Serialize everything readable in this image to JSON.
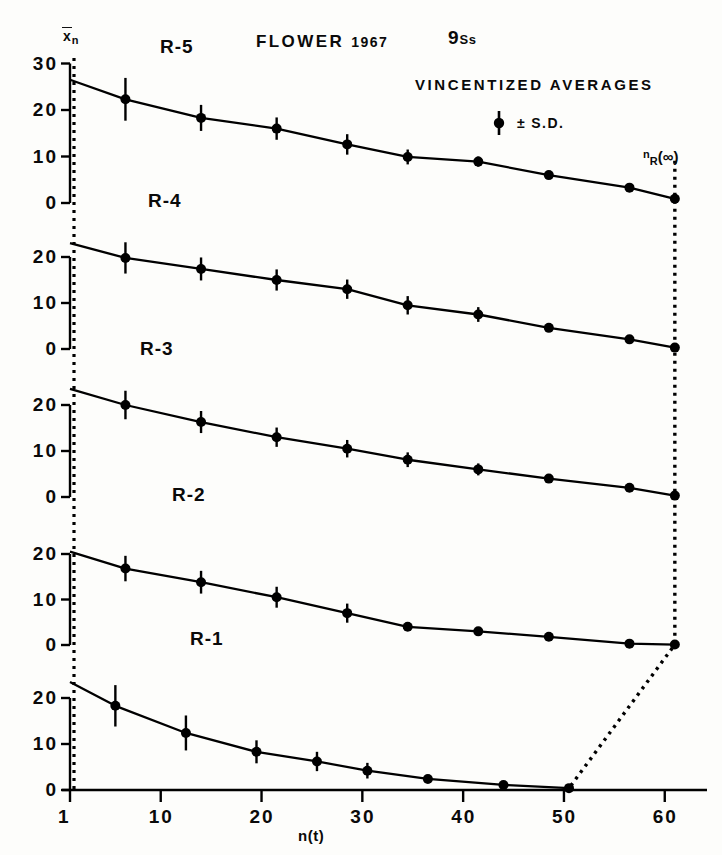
{
  "figure": {
    "title": "FLOWER",
    "year": "1967",
    "subjects": "9",
    "subjects_unit": "Ss",
    "method_note": "VINCENTIZED AVERAGES",
    "legend_sd": "± S.D.",
    "y_axis_label_main": "x",
    "y_axis_label_sub": "n",
    "x_axis_label": "n(t)",
    "asymptote_label_main": "n",
    "asymptote_label_sub": "R",
    "asymptote_label_arg": "(∞)"
  },
  "chart_data": {
    "type": "line",
    "xlabel": "n(t)",
    "ylabel": "x̄n",
    "xlim": [
      1,
      63
    ],
    "grid": false,
    "legend": "± S.D.",
    "legend_position": "top-right",
    "panels": [
      {
        "name": "R-5",
        "label": "R-5",
        "yticks": [
          0,
          10,
          20,
          30
        ],
        "ylim": [
          0,
          31
        ],
        "origin_value": 26.5,
        "x": [
          1,
          6.5,
          14,
          21.5,
          28.5,
          34.5,
          41.5,
          48.5,
          56.5,
          61
        ],
        "y": [
          26.5,
          22.3,
          18.3,
          16.0,
          12.6,
          9.9,
          8.9,
          6.0,
          3.3,
          0.9
        ],
        "sd": [
          0,
          4.6,
          2.8,
          2.4,
          2.2,
          1.6,
          1.1,
          0,
          0,
          0
        ]
      },
      {
        "name": "R-4",
        "label": "R-4",
        "yticks": [
          0,
          10,
          20
        ],
        "ylim": [
          0,
          24
        ],
        "origin_value": 23.0,
        "x": [
          1,
          6.5,
          14,
          21.5,
          28.5,
          34.5,
          41.5,
          48.5,
          56.5,
          61
        ],
        "y": [
          23.0,
          19.8,
          17.4,
          15.0,
          13.0,
          9.5,
          7.5,
          4.6,
          2.1,
          0.3
        ],
        "sd": [
          0,
          3.4,
          2.5,
          2.3,
          2.1,
          2.0,
          1.6,
          0,
          0,
          0
        ]
      },
      {
        "name": "R-3",
        "label": "R-3",
        "yticks": [
          0,
          10,
          20
        ],
        "ylim": [
          0,
          24
        ],
        "origin_value": 23.5,
        "x": [
          1,
          6.5,
          14,
          21.5,
          28.5,
          34.5,
          41.5,
          48.5,
          56.5,
          61
        ],
        "y": [
          23.5,
          20.0,
          16.3,
          13.0,
          10.5,
          8.1,
          6.0,
          4.0,
          2.0,
          0.3
        ],
        "sd": [
          0,
          3.1,
          2.4,
          2.1,
          1.9,
          1.6,
          1.3,
          0,
          0,
          0
        ]
      },
      {
        "name": "R-2",
        "label": "R-2",
        "yticks": [
          0,
          10,
          20
        ],
        "ylim": [
          0,
          22
        ],
        "origin_value": 20.5,
        "x": [
          1,
          6.5,
          14,
          21.5,
          28.5,
          34.5,
          41.5,
          48.5,
          56.5,
          61
        ],
        "y": [
          20.5,
          16.8,
          13.8,
          10.5,
          7.0,
          4.0,
          3.0,
          1.8,
          0.3,
          0.1
        ],
        "sd": [
          0,
          2.8,
          2.5,
          2.3,
          2.1,
          0,
          0,
          0,
          0,
          0
        ]
      },
      {
        "name": "R-1",
        "label": "R-1",
        "yticks": [
          0,
          10,
          20
        ],
        "ylim": [
          0,
          25
        ],
        "origin_value": 23.5,
        "x": [
          1,
          5.5,
          12.5,
          19.5,
          25.5,
          30.5,
          36.5,
          44,
          50.5
        ],
        "y": [
          23.5,
          18.3,
          12.4,
          8.3,
          6.2,
          4.2,
          2.4,
          1.1,
          0.4
        ],
        "sd": [
          0,
          4.5,
          3.8,
          2.5,
          2.1,
          1.7,
          0,
          0,
          0
        ]
      }
    ],
    "xticks": [
      1,
      10,
      20,
      30,
      40,
      50,
      60
    ],
    "xtick_labels": [
      "1",
      "10",
      "20",
      "30",
      "40",
      "50",
      "60"
    ],
    "reference_line_x": 1,
    "asymptote_curve_points": [
      [
        61,
        "R-5"
      ],
      [
        61,
        "R-4"
      ],
      [
        61,
        "R-3"
      ],
      [
        61,
        "R-2"
      ],
      [
        50.5,
        "R-1"
      ]
    ],
    "colors": {
      "line": "#000000",
      "marker": "#000000",
      "background": "#fdfdfb",
      "dotted": "#000000"
    }
  }
}
